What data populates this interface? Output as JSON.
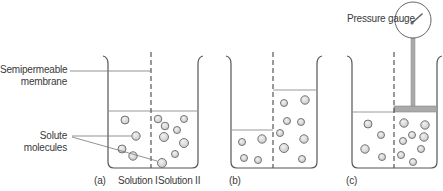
{
  "labels": {
    "membrane_line1": "Semipermeable",
    "membrane_line2": "membrane",
    "solute_line1": "Solute",
    "solute_line2": "molecules",
    "gauge": "Pressure gauge",
    "panel_a": "(a)",
    "panel_b": "(b)",
    "panel_c": "(c)",
    "solution_1": "Solution I",
    "solution_2": "Solution II"
  },
  "colors": {
    "stroke": "#555555",
    "molecule_fill": "#dcdcdc",
    "piston_fill": "#a8a8a8",
    "level_line": "#888888"
  }
}
